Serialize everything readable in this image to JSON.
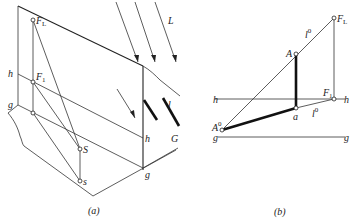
{
  "panel_a": {
    "caption": "(a)",
    "labels": {
      "FL": "F",
      "FL_sub": "L",
      "F1": "F",
      "F1_sub": "1",
      "h_left": "h",
      "g_left": "g",
      "S": "S",
      "s": "s",
      "h_right": "h",
      "g_right": "g",
      "L": "L",
      "l": "l",
      "G": "G"
    }
  },
  "panel_b": {
    "caption": "(b)",
    "labels": {
      "FL": "F",
      "FL_sub": "L",
      "A": "A",
      "a": "a",
      "A0": "A",
      "A0_sup": "0",
      "F1": "F",
      "F1_sub": "1",
      "l0_upper": "l",
      "l0_upper_sup": "0",
      "l0_lower": "l",
      "l0_lower_sup": "0",
      "h_left": "h",
      "h_right": "h",
      "g_left": "g",
      "g_right": "g"
    }
  }
}
